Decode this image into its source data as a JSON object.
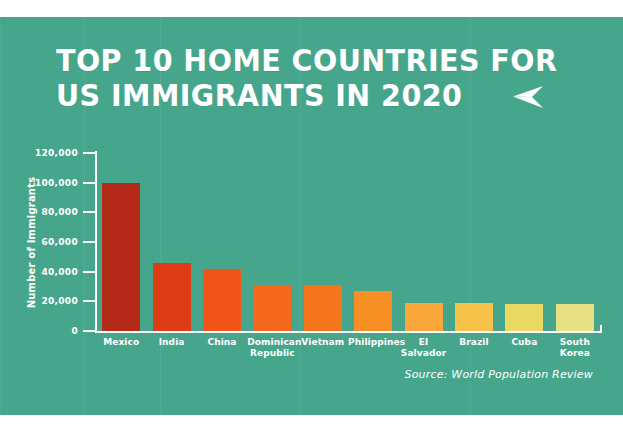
{
  "poster": {
    "background_color": "#46a68c",
    "title_line_1": "TOP 10 HOME COUNTRIES FOR",
    "title_line_2": "US IMMIGRANTS IN 2020",
    "arrow_icon": "paper-plane-left-icon",
    "source_note": "Source: World Population Review"
  },
  "chart_data": {
    "type": "bar",
    "title": "TOP 10 HOME COUNTRIES FOR US IMMIGRANTS IN 2020",
    "xlabel": "",
    "ylabel": "Number of Immigrants",
    "ylim": [
      0,
      120000
    ],
    "grid": false,
    "legend": "none",
    "ytick_labels": [
      "0",
      "20,000",
      "40,000",
      "60,000",
      "80,000",
      "100,000",
      "120,000"
    ],
    "ytick_values": [
      0,
      20000,
      40000,
      60000,
      80000,
      100000,
      120000
    ],
    "categories": [
      "Mexico",
      "India",
      "China",
      "Dominican Republic",
      "Vietnam",
      "Philippines",
      "El Salvador",
      "Brazil",
      "Cuba",
      "South Korea"
    ],
    "values": [
      100000,
      46000,
      42000,
      31000,
      31000,
      27000,
      19000,
      19000,
      18500,
      18500
    ],
    "colors": [
      "#b52a18",
      "#dd3c16",
      "#f2541a",
      "#f5681d",
      "#f5751d",
      "#f79024",
      "#f9a63a",
      "#f6c24a",
      "#e9d862",
      "#e9e284"
    ]
  }
}
